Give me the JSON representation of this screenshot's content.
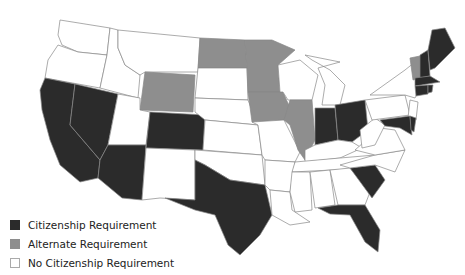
{
  "map": {
    "title": "US states by citizenship requirement",
    "colors": {
      "citizenship": "#2b2b2b",
      "alternate": "#8e8e8e",
      "none": "#ffffff"
    },
    "states": {
      "citizenship": [
        "CA",
        "NV",
        "AZ",
        "CO",
        "TX",
        "SC",
        "FL",
        "IN",
        "OH",
        "MD",
        "DE",
        "ME",
        "NH",
        "MA",
        "CT",
        "RI"
      ],
      "alternate": [
        "WY",
        "ND",
        "MN",
        "IA",
        "IL",
        "VT"
      ],
      "none": [
        "WA",
        "OR",
        "ID",
        "MT",
        "UT",
        "NM",
        "SD",
        "NE",
        "KS",
        "OK",
        "MO",
        "AR",
        "LA",
        "WI",
        "MI",
        "KY",
        "TN",
        "MS",
        "AL",
        "GA",
        "WV",
        "VA",
        "NC",
        "PA",
        "NY",
        "NJ"
      ]
    }
  },
  "legend": {
    "items": [
      {
        "label": "Citizenship Requirement",
        "color": "#2b2b2b"
      },
      {
        "label": "Alternate Requirement",
        "color": "#8e8e8e"
      },
      {
        "label": "No Citizenship Requirement",
        "color": "#ffffff"
      }
    ]
  }
}
